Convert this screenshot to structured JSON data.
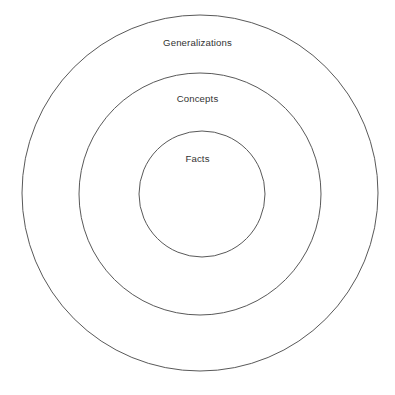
{
  "diagram": {
    "type": "concentric-circles",
    "background_color": "#ffffff",
    "stroke_color": "#595959",
    "text_color": "#333333",
    "center": {
      "x": 200,
      "y": 193
    },
    "rings": [
      {
        "id": "generalizations",
        "label": "Generalizations",
        "level": 3,
        "position": "outer",
        "cx": 200,
        "cy": 193,
        "r": 178,
        "label_y": 43
      },
      {
        "id": "concepts",
        "label": "Concepts",
        "level": 2,
        "position": "middle",
        "cx": 200,
        "cy": 194,
        "r": 121,
        "label_y": 99
      },
      {
        "id": "facts",
        "label": "Facts",
        "level": 1,
        "position": "inner",
        "cx": 202,
        "cy": 194,
        "r": 63,
        "label_y": 159
      }
    ]
  }
}
